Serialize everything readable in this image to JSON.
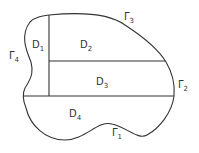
{
  "diagram": {
    "regions": [
      {
        "id": "D1",
        "base": "D",
        "sub": "1",
        "x": 31,
        "y": 42
      },
      {
        "id": "D2",
        "base": "D",
        "sub": "2",
        "x": 79,
        "y": 42
      },
      {
        "id": "D3",
        "base": "D",
        "sub": "3",
        "x": 96,
        "y": 80
      },
      {
        "id": "D4",
        "base": "D",
        "sub": "4",
        "x": 70,
        "y": 112
      }
    ],
    "boundaries": [
      {
        "id": "Gamma1",
        "base": "Γ",
        "sub": "1",
        "x": 113,
        "y": 131
      },
      {
        "id": "Gamma2",
        "base": "Γ",
        "sub": "2",
        "x": 178,
        "y": 82
      },
      {
        "id": "Gamma3",
        "base": "Γ",
        "sub": "3",
        "x": 124,
        "y": 14
      },
      {
        "id": "Gamma4",
        "base": "Γ",
        "sub": "4",
        "x": 9,
        "y": 53
      }
    ],
    "stroke_color": "#333333"
  }
}
